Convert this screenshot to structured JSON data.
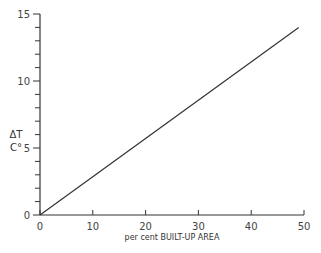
{
  "chart_data": {
    "type": "line",
    "title": "",
    "xlabel": "per cent BUILT-UP AREA",
    "ylabel_line1": "ΔT",
    "ylabel_line2": "C°",
    "xlim": [
      0,
      50
    ],
    "ylim": [
      0,
      15
    ],
    "x_ticks": [
      0,
      10,
      20,
      30,
      40,
      50
    ],
    "y_ticks": [
      0,
      5,
      10,
      15
    ],
    "x_tick_labels": [
      "0",
      "10",
      "20",
      "30",
      "40",
      "50"
    ],
    "y_tick_labels": [
      "0",
      "5",
      "10",
      "15"
    ],
    "grid": false,
    "legend": null,
    "series": [
      {
        "name": "ΔT vs built-up area",
        "x": [
          0,
          49
        ],
        "y": [
          0,
          14
        ]
      }
    ]
  }
}
